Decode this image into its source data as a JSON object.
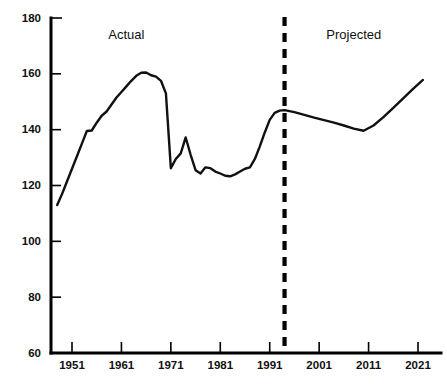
{
  "chart_data": {
    "type": "line",
    "title": "",
    "subtitle": "",
    "xlabel": "",
    "ylabel": "",
    "xlim": [
      1947,
      2023
    ],
    "ylim": [
      60,
      180
    ],
    "grid": false,
    "legend_position": "none",
    "x_ticks": [
      1951,
      1961,
      1971,
      1981,
      1991,
      2001,
      2011,
      2021
    ],
    "x_tick_labels": [
      "1951",
      "1961",
      "1971",
      "1981",
      "1991",
      "2001",
      "2011",
      "2021"
    ],
    "y_ticks": [
      60,
      80,
      100,
      120,
      140,
      160,
      180
    ],
    "y_tick_labels": [
      "60",
      "80",
      "100",
      "120",
      "140",
      "160",
      "180"
    ],
    "annotations": [
      {
        "text": "Actual",
        "x": 1962,
        "y": 176,
        "name": "actual-region-label"
      },
      {
        "text": "Projected",
        "x": 2008,
        "y": 176,
        "name": "projected-region-label"
      }
    ],
    "divider": {
      "type": "vertical-dashed-line",
      "x": 1994,
      "label": "actual-projected-divider"
    },
    "series": [
      {
        "name": "value",
        "color": "#111111",
        "x": [
          1948,
          1949,
          1950,
          1951,
          1952,
          1953,
          1954,
          1955,
          1956,
          1957,
          1958,
          1959,
          1960,
          1961,
          1962,
          1963,
          1964,
          1965,
          1966,
          1967,
          1968,
          1969,
          1970,
          1971,
          1972,
          1973,
          1974,
          1975,
          1976,
          1977,
          1978,
          1979,
          1980,
          1981,
          1982,
          1983,
          1984,
          1985,
          1986,
          1987,
          1988,
          1989,
          1990,
          1991,
          1992,
          1993,
          1994,
          1996,
          1998,
          2000,
          2002,
          2004,
          2006,
          2008,
          2010,
          2012,
          2014,
          2016,
          2018,
          2020,
          2022
        ],
        "y": [
          113.0,
          117.0,
          121.5,
          126.0,
          130.5,
          135.0,
          139.5,
          139.7,
          142.5,
          145.0,
          146.5,
          149.0,
          151.5,
          153.5,
          155.5,
          157.5,
          159.3,
          160.4,
          160.5,
          159.5,
          159.0,
          157.5,
          153.0,
          126.2,
          129.5,
          131.5,
          137.2,
          131.0,
          125.5,
          124.3,
          126.5,
          126.2,
          125.0,
          124.3,
          123.5,
          123.3,
          124.0,
          125.0,
          126.0,
          126.5,
          129.5,
          134.0,
          139.0,
          143.5,
          146.0,
          146.8,
          147.0,
          146.3,
          145.3,
          144.3,
          143.4,
          142.5,
          141.5,
          140.4,
          139.6,
          141.5,
          144.5,
          147.8,
          151.2,
          154.6,
          157.8
        ]
      }
    ]
  },
  "axes": {
    "y_axis_name": "y-axis",
    "x_axis_name": "x-axis"
  }
}
